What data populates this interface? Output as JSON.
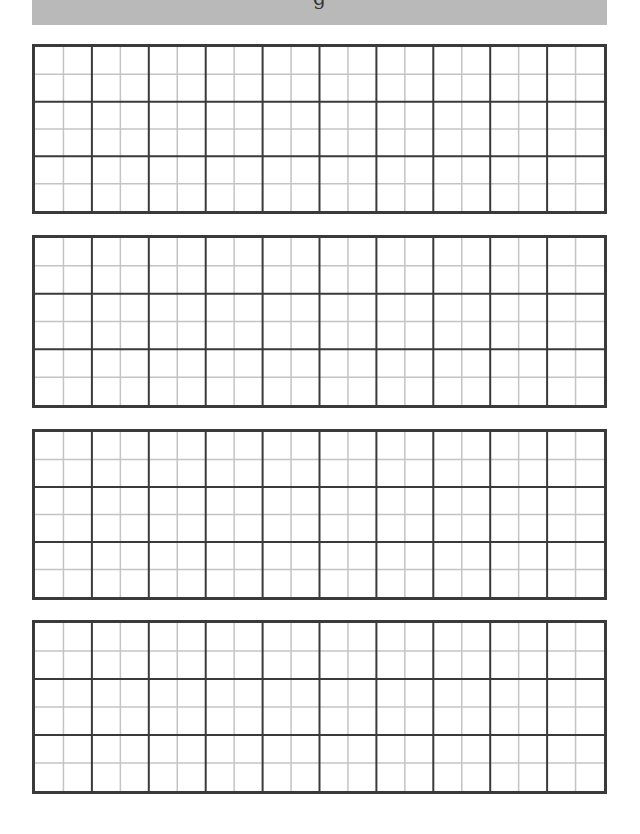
{
  "page": {
    "header": {
      "partial_title_glyph": "g",
      "background_color": "#b9b9b9"
    },
    "grid": {
      "major_columns": 10,
      "minor_per_major_column": 2,
      "major_rows": 3,
      "minor_per_major_row": 2,
      "major_line_color": "#3a3a3a",
      "minor_line_color": "#c4c4c4",
      "border_color": "#3a3a3a"
    },
    "blocks": [
      {
        "label": "block-1",
        "top": 44,
        "height": 170
      },
      {
        "label": "block-2",
        "top": 235,
        "height": 173
      },
      {
        "label": "block-3",
        "top": 429,
        "height": 171
      },
      {
        "label": "block-4",
        "top": 620,
        "height": 174
      }
    ]
  }
}
